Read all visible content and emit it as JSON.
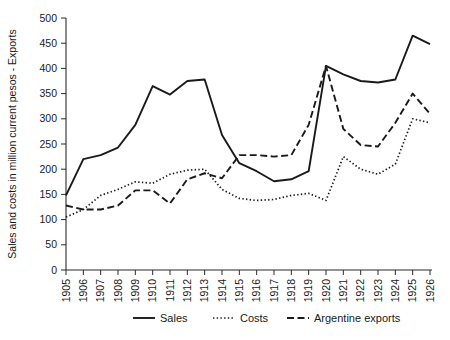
{
  "chart_data": {
    "type": "line",
    "title": "",
    "xlabel": "",
    "ylabel": "Sales and costs in million current pesos - Exports",
    "xlim": [
      1905,
      1926
    ],
    "ylim": [
      0,
      500
    ],
    "yticks": [
      0,
      50,
      100,
      150,
      200,
      250,
      300,
      350,
      400,
      450,
      500
    ],
    "grid": false,
    "legend_position": "bottom",
    "categories": [
      "1905",
      "1906",
      "1907",
      "1908",
      "1909",
      "1910",
      "1911",
      "1912",
      "1913",
      "1914",
      "1915",
      "1916",
      "1917",
      "1918",
      "1919",
      "1920",
      "1921",
      "1922",
      "1923",
      "1924",
      "1925",
      "1926"
    ],
    "series": [
      {
        "name": "Sales",
        "style": "solid",
        "values": [
          148,
          220,
          228,
          243,
          288,
          365,
          348,
          375,
          378,
          268,
          212,
          196,
          176,
          180,
          196,
          405,
          388,
          375,
          372,
          378,
          465,
          448
        ]
      },
      {
        "name": "Costs",
        "style": "dotted",
        "values": [
          105,
          120,
          148,
          160,
          175,
          172,
          190,
          198,
          200,
          160,
          142,
          138,
          140,
          148,
          152,
          138,
          225,
          200,
          190,
          210,
          300,
          292
        ]
      },
      {
        "name": "Argentine exports",
        "style": "dashed",
        "values": [
          128,
          120,
          120,
          128,
          158,
          158,
          132,
          180,
          192,
          182,
          228,
          228,
          225,
          228,
          288,
          405,
          280,
          248,
          245,
          292,
          350,
          310
        ]
      }
    ]
  },
  "legend": {
    "items": [
      {
        "label": "Sales",
        "style": "solid"
      },
      {
        "label": "Costs",
        "style": "dotted"
      },
      {
        "label": "Argentine exports",
        "style": "dashed"
      }
    ]
  }
}
